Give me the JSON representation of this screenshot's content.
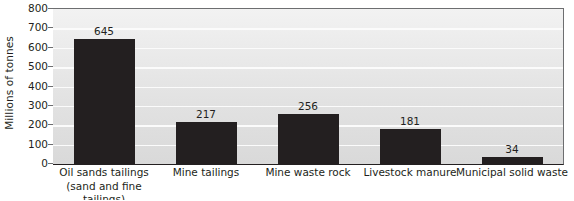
{
  "chart_data": {
    "type": "bar",
    "title": "",
    "subtitle": "",
    "xlabel": "",
    "ylabel": "Millions of tonnes",
    "ylim": [
      0,
      800
    ],
    "ytick_step": 100,
    "yticks": [
      "800",
      "700",
      "600",
      "500",
      "400",
      "300",
      "200",
      "100",
      "0"
    ],
    "grid": "horizontal",
    "legend": "none",
    "categories": [
      "Oil sands tailings (sand and fine tailings)",
      "Mine tailings",
      "Mine waste rock",
      "Livestock manure",
      "Municipal solid waste"
    ],
    "category_lines": [
      [
        "Oil sands tailings",
        "(sand and fine tailings)"
      ],
      [
        "Mine tailings",
        ""
      ],
      [
        "Mine waste rock",
        ""
      ],
      [
        "Livestock manure",
        ""
      ],
      [
        "Municipal solid waste",
        ""
      ]
    ],
    "values": [
      645,
      217,
      256,
      181,
      34
    ],
    "value_labels": [
      "645",
      "217",
      "256",
      "181",
      "34"
    ],
    "bar_color": "#231f20",
    "plot_background": "#e6e6e6",
    "gridline_color": "#fbfbfb",
    "axis_color": "#231f20",
    "text_color": "#231f20"
  }
}
